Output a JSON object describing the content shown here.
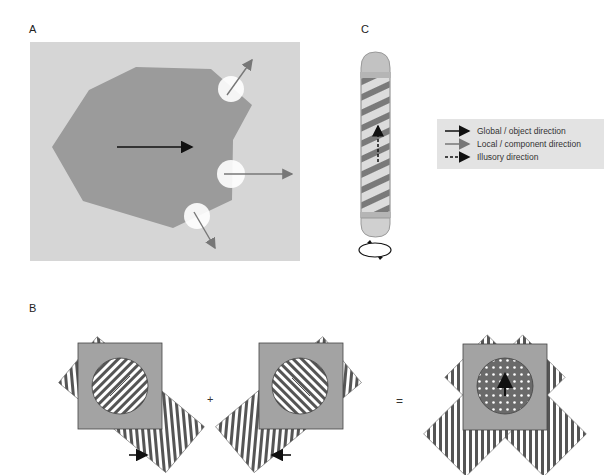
{
  "panels": {
    "a": {
      "label": "A"
    },
    "b": {
      "label": "B",
      "plus": "+",
      "equals": "="
    },
    "c": {
      "label": "C"
    }
  },
  "legend": {
    "items": [
      {
        "label": "Global / object direction",
        "style": "solid-black",
        "color": "#111111"
      },
      {
        "label": "Local / component direction",
        "style": "solid-gray",
        "color": "#777777"
      },
      {
        "label": "Illusory direction",
        "style": "dashed-black",
        "color": "#111111"
      }
    ]
  },
  "colors": {
    "background_a": "#d6d6d6",
    "shape": "#9b9b9b",
    "aperture": "#ffffff",
    "square": "#a3a3a3",
    "stripe_dark": "#555555"
  }
}
